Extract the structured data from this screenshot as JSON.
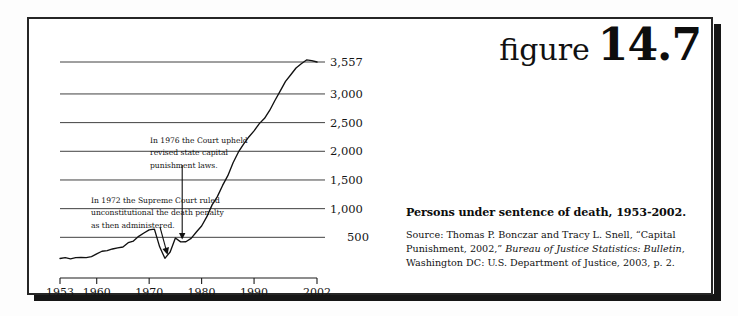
{
  "figure": {
    "word": "figure",
    "number": "14.7"
  },
  "caption": {
    "title": "Persons under sentence of death, 1953-2002.",
    "source_prefix": "Source: Thomas P. Bonczar and Tracy L. Snell, “Capital Punishment, 2002,” ",
    "source_italic": "Bureau of Justice Statistics: Bulletin",
    "source_suffix": ", Washington DC: U.S. Department of Justice, 2003, p. 2."
  },
  "annotations": {
    "a1972": {
      "line1": "In 1972 the Supreme Court ruled",
      "line2": "unconstitutional the death penalty",
      "line3": "as then administered."
    },
    "a1976": {
      "line1": "In 1976 the Court upheld",
      "line2": "revised state capital",
      "line3": "punishment laws."
    }
  },
  "chart_data": {
    "type": "line",
    "title": "Persons under sentence of death, 1953-2002.",
    "xlabel": "",
    "ylabel": "",
    "grid": true,
    "legend": false,
    "xlim": [
      1953,
      2002
    ],
    "ylim": [
      0,
      3557
    ],
    "yticks": [
      500,
      1000,
      1500,
      2000,
      2500,
      3000,
      3557
    ],
    "ytick_labels": [
      "500",
      "1,000",
      "1,500",
      "2,000",
      "2,500",
      "3,000",
      "3,557"
    ],
    "xticks": [
      1953,
      1960,
      1970,
      1980,
      1990,
      2002
    ],
    "xtick_labels": [
      "1953",
      "1960",
      "1970",
      "1980",
      "1990",
      "2002"
    ],
    "line_color": "#111111",
    "grid_color": "#2b2b2b",
    "series": [
      {
        "name": "Persons under sentence of death",
        "x": [
          1953,
          1954,
          1955,
          1956,
          1957,
          1958,
          1959,
          1960,
          1961,
          1962,
          1963,
          1964,
          1965,
          1966,
          1967,
          1968,
          1969,
          1970,
          1971,
          1972,
          1973,
          1974,
          1975,
          1976,
          1977,
          1978,
          1979,
          1980,
          1981,
          1982,
          1983,
          1984,
          1985,
          1986,
          1987,
          1988,
          1989,
          1990,
          1991,
          1992,
          1993,
          1994,
          1995,
          1996,
          1997,
          1998,
          1999,
          2000,
          2001,
          2002
        ],
        "values": [
          131,
          147,
          125,
          146,
          151,
          147,
          164,
          210,
          257,
          267,
          297,
          315,
          331,
          406,
          435,
          517,
          575,
          631,
          642,
          334,
          134,
          244,
          488,
          420,
          423,
          482,
          593,
          697,
          860,
          1066,
          1209,
          1405,
          1575,
          1800,
          1984,
          2124,
          2250,
          2356,
          2482,
          2575,
          2716,
          2890,
          3054,
          3219,
          3335,
          3452,
          3527,
          3593,
          3581,
          3557
        ]
      }
    ],
    "annotations": [
      {
        "text": "In 1972 the Supreme Court ruled unconstitutional the death penalty as then administered.",
        "points_to_year": 1973
      },
      {
        "text": "In 1976 the Court upheld revised state capital punishment laws.",
        "points_to_year": 1976
      }
    ]
  }
}
